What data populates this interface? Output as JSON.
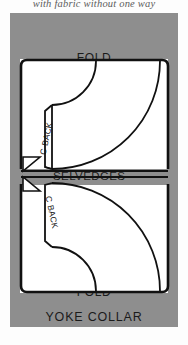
{
  "caption": {
    "top_note": "with fabric without one way"
  },
  "diagram": {
    "title": "YOKE  COLLAR",
    "fold_top_label": "FOLD",
    "fold_bottom_label": "FOLD",
    "selvedges_label": "SELVEDGES",
    "pieces": [
      {
        "label": "C BACK",
        "panel": "upper"
      },
      {
        "label": "C BACK",
        "panel": "lower"
      }
    ],
    "colors": {
      "page_gray": "#8e8e8e",
      "fabric_white": "#ffffff",
      "ink": "#111111"
    }
  }
}
